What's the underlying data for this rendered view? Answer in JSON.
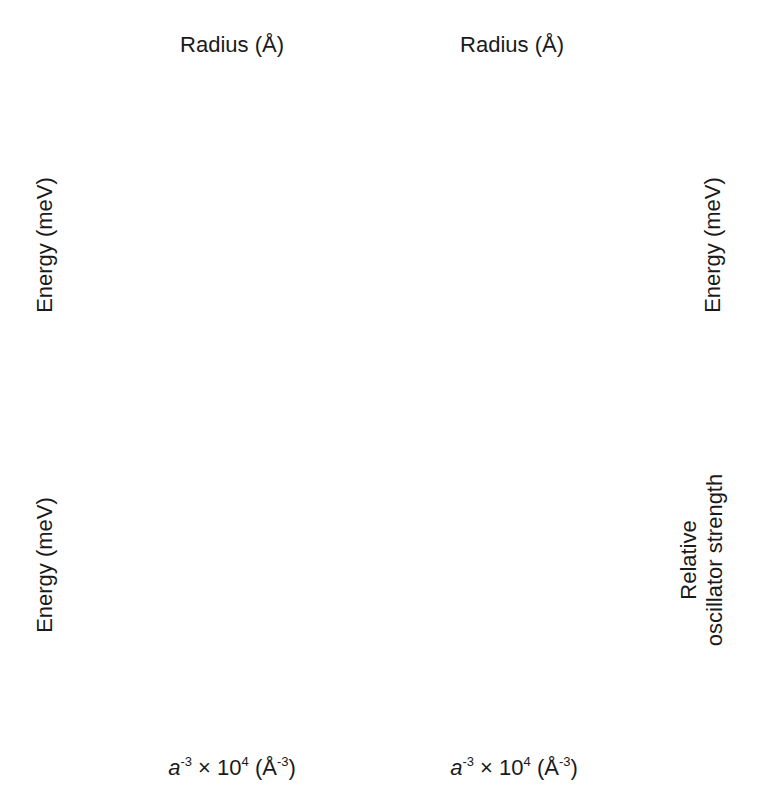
{
  "figure": {
    "top_axis_title": "Radius (Å)",
    "bottom_axis_title": "a⁻³ × 10⁴ (Å⁻³)",
    "left_axis_title": "Energy (meV)",
    "right_axis_title_b": "Energy (meV)",
    "right_axis_title_d_line1": "Relative",
    "right_axis_title_d_line2": "oscillator strength"
  },
  "chart_data": [
    {
      "panel": "(a)",
      "type": "line",
      "title": "",
      "xlabel": "",
      "x2label": "Radius (Å)",
      "ylabel": "Energy (meV)",
      "xlim": [
        0,
        10
      ],
      "ylim": [
        -40,
        60
      ],
      "yticks": [
        60,
        40,
        20,
        0,
        -20,
        -40
      ],
      "top_ticks": [
        {
          "pos": 0.37,
          "label": "30"
        },
        {
          "pos": 1.71,
          "label": "18"
        },
        {
          "pos": 2.96,
          "label": "15"
        },
        {
          "pos": 4.55,
          "label": "13"
        },
        {
          "pos": 5.79,
          "label": "12"
        },
        {
          "pos": 7.51,
          "label": "11"
        },
        {
          "pos": 10.0,
          "label": "10"
        }
      ],
      "series": [
        {
          "name": "0U",
          "label": "0",
          "sup": "U",
          "style": "solid",
          "x": [
            0,
            1,
            2,
            3,
            4,
            5,
            6,
            6.5,
            7.5,
            8,
            9,
            10
          ],
          "y": [
            12,
            15.5,
            19.5,
            23.5,
            27.5,
            32,
            36,
            38,
            null,
            46,
            51,
            56
          ],
          "label_pos": [
            7.5,
            40
          ]
        },
        {
          "name": "±1U",
          "label": "±1",
          "sup": "U",
          "style": "solid",
          "x": [
            0,
            0.5,
            1,
            2,
            3,
            4,
            5,
            6,
            6.5,
            7.5,
            8,
            9,
            10
          ],
          "y": [
            12,
            11,
            11,
            12.5,
            15,
            18,
            21.5,
            25,
            27,
            null,
            32,
            37,
            41
          ],
          "label_pos": [
            7.4,
            26
          ]
        },
        {
          "name": "0L",
          "label": "0",
          "sup": "L",
          "style": "dashed",
          "x": [
            0,
            2,
            4,
            6,
            6.5,
            7.5,
            8,
            9,
            10
          ],
          "y": [
            12,
            6,
            0,
            -5,
            -6.5,
            null,
            -9,
            -12,
            -15
          ],
          "label_pos": [
            7.5,
            -5.5
          ]
        },
        {
          "name": "±1L",
          "label": "±1",
          "sup": "L",
          "style": "solid",
          "x": [
            0,
            1,
            2,
            3,
            4,
            5,
            6,
            6.5,
            7.5,
            8,
            9,
            10
          ],
          "y": [
            -11,
            -8.5,
            -7.8,
            -7.8,
            -8.5,
            -10,
            -12,
            -13.5,
            null,
            -17,
            -19.5,
            -22
          ],
          "label_pos": [
            7.4,
            -20
          ]
        },
        {
          "name": "±2",
          "label": "±2",
          "sup": "",
          "style": "dashed",
          "x": [
            0,
            2,
            4,
            6,
            6.5,
            7.5,
            8,
            9,
            10
          ],
          "y": [
            -11,
            -17,
            -22,
            -27,
            -29,
            null,
            -33,
            -35.5,
            -38
          ],
          "label_pos": [
            7.4,
            -31
          ]
        }
      ]
    },
    {
      "panel": "(b)",
      "type": "line",
      "title": "",
      "xlabel": "",
      "x2label": "Radius (Å)",
      "ylabel": "Energy (meV)",
      "xlim": [
        0,
        10
      ],
      "ylim": [
        -40,
        60
      ],
      "yticks": [
        60,
        40,
        20,
        0,
        -20,
        -40
      ],
      "top_ticks": [
        {
          "pos": 0.37,
          "label": "30"
        },
        {
          "pos": 1.71,
          "label": "18"
        },
        {
          "pos": 2.96,
          "label": "15"
        },
        {
          "pos": 4.55,
          "label": "13"
        },
        {
          "pos": 5.79,
          "label": "12"
        },
        {
          "pos": 7.51,
          "label": "11"
        },
        {
          "pos": 10.0,
          "label": "10"
        }
      ],
      "series": [
        {
          "name": "±1U",
          "label": "±1",
          "sup": "U",
          "style": "solid",
          "x": [
            0,
            0.4,
            0.7,
            1.2,
            2,
            3,
            3.8,
            null,
            5.5,
            6,
            7,
            7.7
          ],
          "y": [
            -8,
            -2,
            1,
            5,
            13,
            23,
            30,
            null,
            48,
            52,
            58,
            60
          ],
          "label_pos": [
            4.5,
            39
          ]
        },
        {
          "name": "±2",
          "label": "±2",
          "sup": "",
          "style": "dashed",
          "x": [
            0,
            0.5,
            1,
            2,
            3,
            4,
            null,
            5.5,
            6,
            7,
            8,
            9,
            10
          ],
          "y": [
            -8,
            -3,
            0,
            4,
            7,
            9.5,
            null,
            13.5,
            14.5,
            15.5,
            16.5,
            17.5,
            18.5
          ],
          "label_pos": [
            4.7,
            12
          ]
        },
        {
          "name": "0U",
          "label": "0",
          "sup": "U",
          "style": "solid",
          "x": [
            0,
            0.5,
            1,
            2,
            3,
            4,
            null,
            5.5,
            6,
            7,
            8,
            9,
            10
          ],
          "y": [
            10,
            6,
            4,
            1.5,
            0,
            -0.5,
            null,
            -1,
            -1,
            -0.5,
            -0.3,
            0.3,
            1
          ],
          "label_pos": [
            4.7,
            -2
          ]
        },
        {
          "name": "±1L",
          "label": "±1",
          "sup": "L",
          "style": "solid",
          "x": [
            0,
            0.5,
            1,
            2,
            3,
            4
          ],
          "y": [
            10,
            6,
            2,
            -7,
            -16,
            -26
          ],
          "label_pos": [
            5.0,
            -27
          ]
        },
        {
          "name": "0L",
          "label": "0",
          "sup": "L",
          "style": "dashed",
          "x": [
            0,
            0.5,
            1,
            2,
            3,
            4
          ],
          "y": [
            10,
            5.5,
            0.5,
            -9,
            -18,
            -29
          ],
          "label_pos": [
            4.5,
            -34
          ]
        },
        {
          "name": "±1L-cont",
          "label": "",
          "sup": "",
          "style": "solid",
          "x": [
            5.5,
            6,
            6.6
          ],
          "y": [
            -33,
            -37,
            -40
          ],
          "label_pos": null
        },
        {
          "name": "0L-cont",
          "label": "",
          "sup": "",
          "style": "solid",
          "x": [
            5.1,
            5.7
          ],
          "y": [
            -36.5,
            -40
          ],
          "label_pos": null
        }
      ]
    },
    {
      "panel": "(c)",
      "type": "line",
      "title": "",
      "xlabel": "a⁻³ × 10⁴ (Å⁻³)",
      "ylabel": "Energy (meV)",
      "xlim": [
        0,
        10
      ],
      "ylim": [
        -40,
        60
      ],
      "xticks": [
        0,
        2,
        4,
        6,
        8,
        10
      ],
      "yticks": [
        60,
        40,
        20,
        0,
        -20,
        -40
      ],
      "series": [
        {
          "name": "0U",
          "label": "0",
          "sup": "U",
          "style": "solid",
          "x": [
            0,
            0.3,
            0.6,
            1,
            1.5,
            2,
            3,
            4,
            5,
            6,
            6.5,
            null,
            7.5,
            8,
            9,
            10
          ],
          "y": [
            9,
            8.5,
            9,
            11,
            14,
            18,
            25,
            31,
            36,
            40,
            42,
            null,
            46,
            49,
            53,
            57
          ],
          "label_pos": [
            7.5,
            40
          ]
        },
        {
          "name": "±1U",
          "label": "±1",
          "sup": "U",
          "style": "solid",
          "x": [
            0,
            0.3,
            0.6,
            1,
            2,
            3,
            4,
            5,
            6,
            6.5,
            null,
            7.5,
            8,
            9,
            10
          ],
          "y": [
            9,
            7,
            6.5,
            7.5,
            11,
            14.5,
            18,
            21.5,
            25,
            26.5,
            null,
            32,
            34,
            37.5,
            41
          ],
          "label_pos": [
            7.4,
            26
          ]
        },
        {
          "name": "0L",
          "label": "0",
          "sup": "L",
          "style": "dashed",
          "x": [
            0,
            0.3,
            0.6,
            1,
            2,
            3,
            4,
            5,
            6,
            6.5,
            null,
            7.5,
            8,
            9,
            10
          ],
          "y": [
            9,
            5.5,
            4.5,
            4,
            3.5,
            2,
            0,
            -2.5,
            -5,
            -6.5,
            null,
            -9,
            -10,
            -12.5,
            -15
          ],
          "label_pos": [
            7.5,
            -5.5
          ]
        },
        {
          "name": "±1L",
          "label": "±1",
          "sup": "L",
          "style": "solid",
          "x": [
            0,
            0.2,
            0.5,
            1,
            2,
            3,
            4,
            5,
            6,
            6.5,
            null,
            7.5,
            8,
            9,
            10
          ],
          "y": [
            -8,
            -6,
            -4.8,
            -4.8,
            -6.5,
            -8.5,
            -10,
            -11.5,
            -13,
            -14,
            null,
            -17,
            -18.5,
            -20,
            -22
          ],
          "label_pos": [
            7.4,
            -20
          ]
        },
        {
          "name": "±2",
          "label": "±2",
          "sup": "",
          "style": "dashed",
          "x": [
            0,
            0.5,
            1,
            2,
            3,
            4,
            5,
            6,
            6.5,
            null,
            7.5,
            8,
            9,
            10
          ],
          "y": [
            -8,
            -8,
            -10,
            -16,
            -21,
            -24,
            -26.5,
            -28.5,
            -29.5,
            null,
            -33,
            -34,
            -36,
            -38
          ],
          "label_pos": [
            7.4,
            -31
          ]
        }
      ]
    },
    {
      "panel": "(d)",
      "type": "line",
      "title": "",
      "xlabel": "a⁻³ × 10⁴ (Å⁻³)",
      "ylabel": "Relative oscillator strength",
      "xlim": [
        0,
        10
      ],
      "ylim": [
        0,
        2
      ],
      "xticks": [
        0,
        2,
        4,
        6,
        8,
        10
      ],
      "yticks": [
        2,
        1,
        0
      ],
      "series": [
        {
          "name": "±1U",
          "label": "±1",
          "sup": "U",
          "style": "solid",
          "x": [
            0,
            0.2,
            0.4,
            0.6,
            0.8,
            1,
            1.5,
            2,
            2.5,
            3.4,
            null,
            5.2,
            6,
            7,
            8,
            9,
            10
          ],
          "y": [
            0.45,
            0.55,
            0.7,
            0.85,
            1.0,
            1.15,
            1.3,
            1.4,
            1.5,
            1.6,
            null,
            1.78,
            1.82,
            1.87,
            1.9,
            1.92,
            1.93
          ],
          "label_pos": [
            4.0,
            1.7
          ]
        },
        {
          "name": "0U",
          "label": "0",
          "sup": "U",
          "style": "solid",
          "x": [
            0,
            3.3,
            null,
            5.2,
            10
          ],
          "y": [
            1.0,
            1.0,
            null,
            1.0,
            1.0
          ],
          "label_pos": [
            4.2,
            0.97
          ]
        },
        {
          "name": "±1L",
          "label": "±1",
          "sup": "L",
          "style": "solid",
          "x": [
            0,
            0.2,
            0.4,
            0.6,
            0.8,
            1,
            1.5,
            2,
            2.5,
            3.4,
            null,
            5.2,
            6,
            7,
            8,
            9,
            10
          ],
          "y": [
            1.53,
            1.45,
            1.3,
            1.15,
            1.0,
            0.87,
            0.72,
            0.6,
            0.5,
            0.37,
            null,
            0.22,
            0.17,
            0.12,
            0.09,
            0.07,
            0.06
          ],
          "label_pos": [
            4.0,
            0.27
          ]
        }
      ]
    }
  ]
}
